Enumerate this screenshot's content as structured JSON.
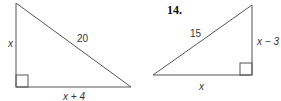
{
  "left_triangle": {
    "vertices": [
      [
        16,
        3
      ],
      [
        16,
        87
      ],
      [
        131,
        87
      ]
    ],
    "right_angle_at": [
      16,
      87
    ],
    "labels": {
      "vertical_leg": "x",
      "hypotenuse": "20",
      "horizontal_leg": "x + 4"
    }
  },
  "right_triangle": {
    "problem_number": "14.",
    "vertices": [
      [
        153,
        75
      ],
      [
        252,
        5
      ],
      [
        252,
        75
      ]
    ],
    "right_angle_at": [
      252,
      75
    ],
    "labels": {
      "hypotenuse": "15",
      "vertical_leg": "x − 3",
      "horizontal_leg": "x"
    }
  },
  "colors": {
    "stroke": "#444444",
    "text": "#333333"
  }
}
